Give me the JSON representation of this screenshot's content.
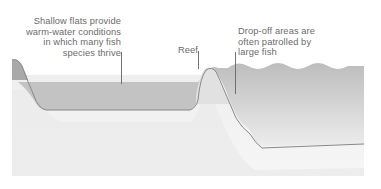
{
  "diagram": {
    "type": "cross-section",
    "labels": [
      {
        "id": "shallow-flats",
        "text": "Shallow flats provide\nwarm-water conditions\nin which many fish\nspecies thrive"
      },
      {
        "id": "reef",
        "text": "Reef"
      },
      {
        "id": "drop-off",
        "text": "Drop-off areas are\noften patrolled by\nlarge fish"
      }
    ],
    "colors": {
      "water_surface": "#b9b9b9",
      "water_shallow": "#c4c4c4",
      "water_deep_top": "#bdbdbd",
      "water_deep_bottom": "#ececec",
      "seabed_outline": "#8a8a8a",
      "sediment_light": "#f1f1f1",
      "sediment_mid": "#e6e6e6",
      "land": "#a8a8a8",
      "text": "#6b6b6b"
    }
  }
}
